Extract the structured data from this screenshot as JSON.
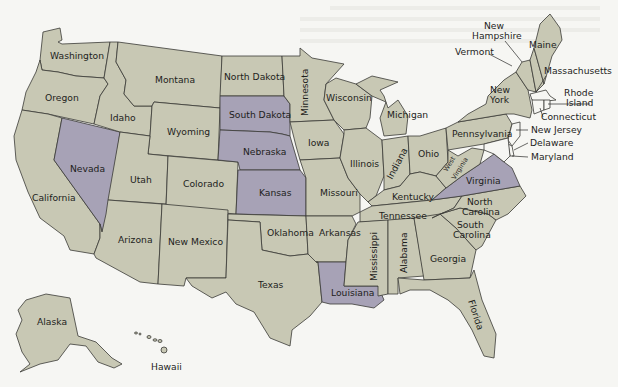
{
  "map": {
    "colors": {
      "default_state": "#c8c8b4",
      "highlighted_state": "#a7a2b6",
      "small_state": "#f6f6f3",
      "border": "#3a3a36",
      "background": "#f6f6f3"
    },
    "highlighted_states": [
      "South Dakota",
      "Nebraska",
      "Kansas",
      "Nevada",
      "Louisiana",
      "Virginia"
    ],
    "states": {
      "washington": "Washington",
      "oregon": "Oregon",
      "california": "California",
      "idaho": "Idaho",
      "nevada": "Nevada",
      "montana": "Montana",
      "wyoming": "Wyoming",
      "utah": "Utah",
      "colorado": "Colorado",
      "arizona": "Arizona",
      "new_mexico": "New Mexico",
      "north_dakota": "North Dakota",
      "south_dakota": "South Dakota",
      "nebraska": "Nebraska",
      "kansas": "Kansas",
      "oklahoma": "Oklahoma",
      "texas": "Texas",
      "minnesota": "Minnesota",
      "iowa": "Iowa",
      "missouri": "Missouri",
      "arkansas": "Arkansas",
      "louisiana": "Louisiana",
      "wisconsin": "Wisconsin",
      "illinois": "Illinois",
      "michigan": "Michigan",
      "indiana": "Indiana",
      "ohio": "Ohio",
      "kentucky": "Kentucky",
      "tennessee": "Tennessee",
      "mississippi": "Mississippi",
      "alabama": "Alabama",
      "georgia": "Georgia",
      "florida": "Florida",
      "south_carolina": "South Carolina",
      "north_carolina": "North Carolina",
      "virginia": "Virginia",
      "west_virginia": "West Virginia",
      "pennsylvania": "Pennsylvania",
      "new_york": "New York",
      "vermont": "Vermont",
      "new_hampshire": "New Hampshire",
      "maine": "Maine",
      "massachusetts": "Massachusetts",
      "rhode_island": "Rhode Island",
      "connecticut": "Connecticut",
      "new_jersey": "New Jersey",
      "delaware": "Delaware",
      "maryland": "Maryland",
      "alaska": "Alaska",
      "hawaii": "Hawaii"
    },
    "multiline": {
      "new_hampshire": [
        "New",
        "Hampshire"
      ],
      "new_york": [
        "New",
        "York"
      ],
      "rhode_island": [
        "Rhode",
        "Island"
      ],
      "north_carolina": [
        "North",
        "Carolina"
      ],
      "south_carolina": [
        "South",
        "Carolina"
      ],
      "west_virginia": [
        "West",
        "Virginia"
      ]
    }
  }
}
